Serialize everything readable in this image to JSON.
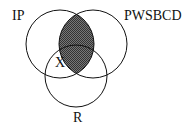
{
  "diagram": {
    "type": "venn",
    "sets": [
      {
        "id": "IP",
        "label": "IP",
        "cx": 60,
        "cy": 44,
        "r": 34
      },
      {
        "id": "PWSBCD",
        "label": "PWSBCD",
        "cx": 93,
        "cy": 44,
        "r": 34
      },
      {
        "id": "R",
        "label": "R",
        "cx": 76,
        "cy": 76,
        "r": 31
      }
    ],
    "shaded_region": "IP ∩ PWSBCD",
    "shade_color": "#555555",
    "marker": {
      "label": "X",
      "region": "IP ∩ R (not PWSBCD)"
    }
  }
}
